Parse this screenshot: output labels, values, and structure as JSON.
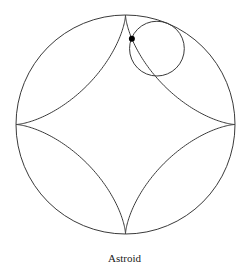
{
  "figure": {
    "caption": "Astroid",
    "stroke_color": "#3a3a3a",
    "point_color": "#000000",
    "outer_circle": {
      "cx": 125.5,
      "cy": 124.5,
      "r": 109.5
    },
    "rolling_circle": {
      "r_ratio": 0.25,
      "angle_deg": -67.5
    },
    "tracing_point": {
      "t_deg": 67.2
    }
  }
}
